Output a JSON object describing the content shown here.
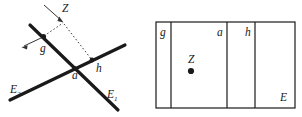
{
  "figure": {
    "background_color": "#ffffff",
    "stroke_color": "#1a1a1a",
    "dotted_color": "#555555",
    "panels": [
      {
        "id": "left-panel",
        "name": "intersecting-lines-diagram",
        "description": "Two thick straight lines crossing at point a, with marked points g and h and an external point Z joined by dotted segments",
        "labels": [
          {
            "key": "label_E2",
            "text": "E",
            "sub": "2",
            "x": 10,
            "y": 93
          },
          {
            "key": "label_E1",
            "text": "E",
            "sub": "1",
            "x": 107,
            "y": 98
          },
          {
            "key": "label_a",
            "text": "a",
            "sub": "",
            "x": 72,
            "y": 79
          },
          {
            "key": "label_h",
            "text": "h",
            "sub": "",
            "x": 96,
            "y": 72
          },
          {
            "key": "label_g",
            "text": "g",
            "sub": "",
            "x": 40,
            "y": 52
          },
          {
            "key": "label_Z",
            "text": "Z",
            "sub": "",
            "x": 62,
            "y": 12
          }
        ],
        "points": [
          {
            "key": "point_a",
            "label": "a",
            "x": 74.5,
            "y": 68.5
          },
          {
            "key": "point_g",
            "label": "g",
            "x": 43.5,
            "y": 36.5
          },
          {
            "key": "point_h",
            "label": "h",
            "x": 92.0,
            "y": 60.0
          },
          {
            "key": "point_Z",
            "label": "Z",
            "x": 63.0,
            "y": 22.0
          }
        ]
      },
      {
        "id": "right-panel",
        "name": "partitioned-rectangle-diagram",
        "description": "A rectangle E subdivided by three vertical lines into four cells labelled g, a, h with interior point Z",
        "rect": {
          "x": 156,
          "y": 22,
          "width": 139,
          "height": 86
        },
        "dividers_x": [
          171,
          227,
          255
        ],
        "labels": [
          {
            "key": "label_g_cell",
            "text": "g",
            "sub": "",
            "x": 160,
            "y": 36
          },
          {
            "key": "label_a_cell",
            "text": "a",
            "sub": "",
            "x": 217,
            "y": 36
          },
          {
            "key": "label_h_cell",
            "text": "h",
            "sub": "",
            "x": 245,
            "y": 36
          },
          {
            "key": "label_E_cell",
            "text": "E",
            "sub": "",
            "x": 280,
            "y": 101
          },
          {
            "key": "label_Z_cell",
            "text": "Z",
            "sub": "",
            "x": 188,
            "y": 63
          }
        ],
        "points": [
          {
            "key": "point_Z_cell",
            "label": "Z",
            "x": 191,
            "y": 71
          }
        ]
      }
    ]
  }
}
